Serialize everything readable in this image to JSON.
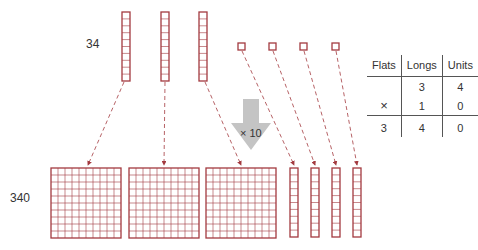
{
  "labels": {
    "top_number": "34",
    "bottom_number": "340",
    "multiplier": "× 10"
  },
  "colors": {
    "block_stroke": "#a33a3f",
    "arrow_fill": "#c4c4c4",
    "text": "#333333"
  },
  "top_row": {
    "longs": 3,
    "units": 4
  },
  "bottom_row": {
    "flats": 3,
    "longs": 4
  },
  "table": {
    "headers": [
      "Flats",
      "Longs",
      "Units"
    ],
    "rows": [
      {
        "op": "",
        "flats": "",
        "longs": "3",
        "units": "4"
      },
      {
        "op": "×",
        "flats": "",
        "longs": "1",
        "units": "0"
      }
    ],
    "result": {
      "flats": "3",
      "longs": "4",
      "units": "0"
    }
  }
}
